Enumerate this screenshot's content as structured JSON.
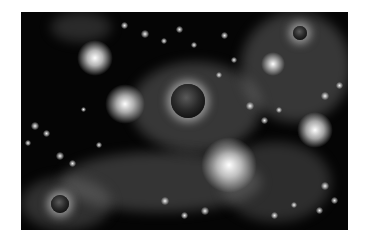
{
  "image": {
    "description": "Grayscale space scene with glowing star clusters and three dark planets",
    "background": "#ffffff",
    "scene_color": "#050505",
    "planets": [
      {
        "name": "center-planet",
        "x": 170,
        "y": 82,
        "size": 34
      },
      {
        "name": "top-right-planet",
        "x": 292,
        "y": 25,
        "size": 14
      },
      {
        "name": "bottom-left-planet",
        "x": 50,
        "y": 195,
        "size": 18
      }
    ],
    "glows": [
      {
        "x": 92,
        "y": 56,
        "size": 32
      },
      {
        "x": 122,
        "y": 100,
        "size": 34
      },
      {
        "x": 315,
        "y": 128,
        "size": 32
      },
      {
        "x": 225,
        "y": 163,
        "size": 48
      },
      {
        "x": 275,
        "y": 57,
        "size": 22
      }
    ]
  }
}
